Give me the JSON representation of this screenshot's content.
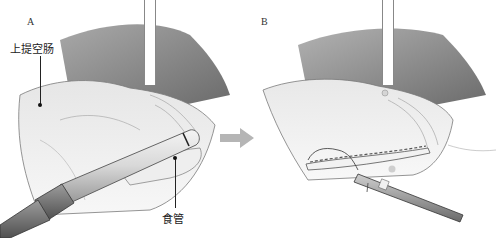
{
  "figure": {
    "panels": [
      {
        "label": "A",
        "callouts": [
          {
            "text": "上提空肠"
          },
          {
            "text": "食管"
          }
        ]
      },
      {
        "label": "B",
        "callouts": []
      }
    ],
    "arrow": {
      "direction": "right",
      "color": "#b5b5b5"
    },
    "colors": {
      "background": "#ffffff",
      "tissue_shadow": "#6e6e6e",
      "instrument": "#8a8a8a"
    }
  }
}
